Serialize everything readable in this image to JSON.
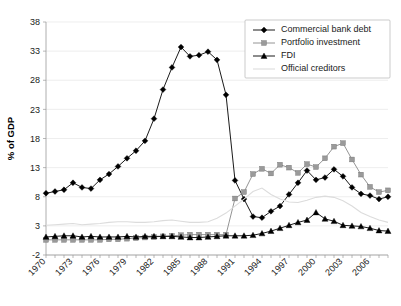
{
  "chart_data": {
    "type": "line",
    "title": "",
    "xlabel": "",
    "ylabel": "% of GDP",
    "xlim": [
      1970,
      2008
    ],
    "ylim": [
      -2,
      38
    ],
    "grid": true,
    "legend_position": "top-right",
    "y_ticks": [
      -2,
      3,
      8,
      13,
      18,
      23,
      28,
      33,
      38
    ],
    "x_ticks": [
      1970,
      1973,
      1976,
      1979,
      1982,
      1985,
      1988,
      1991,
      1994,
      1997,
      2000,
      2003,
      2006
    ],
    "x": [
      1970,
      1971,
      1972,
      1973,
      1974,
      1975,
      1976,
      1977,
      1978,
      1979,
      1980,
      1981,
      1982,
      1983,
      1984,
      1985,
      1986,
      1987,
      1988,
      1989,
      1990,
      1991,
      1992,
      1993,
      1994,
      1995,
      1996,
      1997,
      1998,
      1999,
      2000,
      2001,
      2002,
      2003,
      2004,
      2005,
      2006,
      2007,
      2008
    ],
    "series": [
      {
        "name": "Commercial bank debt",
        "marker": "diamond",
        "color": "#000000",
        "values": [
          8.6,
          8.9,
          9.2,
          10.4,
          9.6,
          9.4,
          10.9,
          11.9,
          13.2,
          14.6,
          15.9,
          17.6,
          21.4,
          26.4,
          30.2,
          33.7,
          32.1,
          32.3,
          32.9,
          31.5,
          25.5,
          10.8,
          7.6,
          4.6,
          4.4,
          5.5,
          6.4,
          8.4,
          10.4,
          12.5,
          10.9,
          11.3,
          12.7,
          11.5,
          9.6,
          8.5,
          8.2,
          7.6,
          8.0
        ]
      },
      {
        "name": "Portfolio investment",
        "marker": "square",
        "color": "#9a9a9a",
        "values": [
          0.6,
          0.6,
          0.6,
          0.6,
          0.6,
          0.6,
          0.6,
          0.7,
          0.7,
          0.8,
          0.9,
          1.0,
          1.1,
          1.2,
          1.3,
          1.4,
          1.5,
          1.5,
          1.5,
          1.5,
          1.5,
          7.7,
          8.8,
          11.9,
          12.8,
          12.0,
          13.5,
          13.0,
          12.1,
          13.6,
          13.1,
          14.6,
          16.6,
          17.2,
          14.4,
          11.8,
          9.7,
          8.8,
          9.1
        ]
      },
      {
        "name": "FDI",
        "marker": "triangle",
        "color": "#000000",
        "values": [
          1.1,
          1.2,
          1.3,
          1.3,
          1.1,
          1.2,
          1.1,
          1.1,
          1.1,
          1.2,
          1.1,
          1.2,
          1.2,
          1.2,
          1.2,
          1.1,
          1.0,
          1.0,
          1.1,
          1.2,
          1.3,
          1.3,
          1.3,
          1.4,
          1.7,
          2.1,
          2.6,
          3.1,
          3.6,
          4.0,
          5.3,
          4.2,
          3.8,
          3.1,
          3.0,
          2.9,
          2.6,
          2.2,
          2.1
        ]
      },
      {
        "name": "Official creditors",
        "marker": "none",
        "color": "#dcdcdc",
        "values": [
          3.1,
          3.2,
          3.3,
          3.4,
          3.2,
          3.3,
          3.4,
          3.6,
          3.7,
          3.7,
          3.6,
          3.6,
          3.7,
          3.9,
          4.0,
          3.8,
          3.6,
          3.6,
          3.7,
          4.3,
          5.2,
          6.4,
          7.6,
          8.9,
          9.5,
          8.4,
          7.6,
          7.1,
          7.0,
          7.4,
          7.9,
          8.1,
          7.9,
          7.3,
          6.4,
          5.3,
          4.6,
          4.0,
          3.6
        ]
      }
    ]
  },
  "legend": {
    "items": [
      {
        "label": "Commercial bank debt",
        "marker": "diamond",
        "color": "#000000"
      },
      {
        "label": "Portfolio investment",
        "marker": "square",
        "color": "#9a9a9a"
      },
      {
        "label": "FDI",
        "marker": "triangle",
        "color": "#000000"
      },
      {
        "label": "Official creditors",
        "marker": "none",
        "color": "#dcdcdc"
      }
    ]
  }
}
